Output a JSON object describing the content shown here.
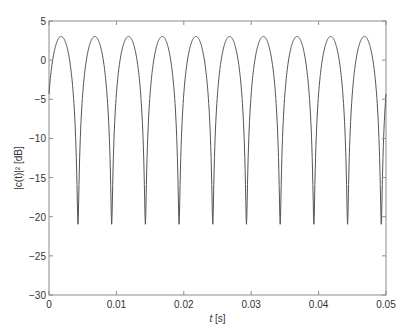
{
  "chart_data": {
    "type": "line",
    "title": "",
    "xlabel_italic": "t",
    "xlabel_rest": " [s]",
    "ylabel": "|c(t)|² [dB]",
    "xlim": [
      0,
      0.05
    ],
    "ylim": [
      -30,
      5
    ],
    "xticks": [
      0,
      0.01,
      0.02,
      0.03,
      0.04,
      0.05
    ],
    "xtick_labels": [
      "0",
      "0.01",
      "0.02",
      "0.03",
      "0.04",
      "0.05"
    ],
    "yticks": [
      -30,
      -25,
      -20,
      -15,
      -10,
      -5,
      0,
      5
    ],
    "ytick_labels": [
      "−30",
      "−25",
      "−20",
      "−15",
      "−10",
      "−5",
      "0",
      "5"
    ],
    "grid": false,
    "legend": "none",
    "series": [
      {
        "name": "|c(t)|^2",
        "color": "#555555",
        "description": "Periodic fading: 10*log10(2*cos^2(pi*(t - 0.0018)/0.005) + 0.008)",
        "period_s": 0.005,
        "peak_db": 3,
        "min_db": -21,
        "first_peak_s": 0.0018,
        "minima_s": [
          0.0043,
          0.0093,
          0.0143,
          0.0193,
          0.0243,
          0.0293,
          0.0343,
          0.0393,
          0.0443,
          0.0493
        ],
        "start_value_db": -4.4,
        "samples": 1000
      }
    ]
  }
}
